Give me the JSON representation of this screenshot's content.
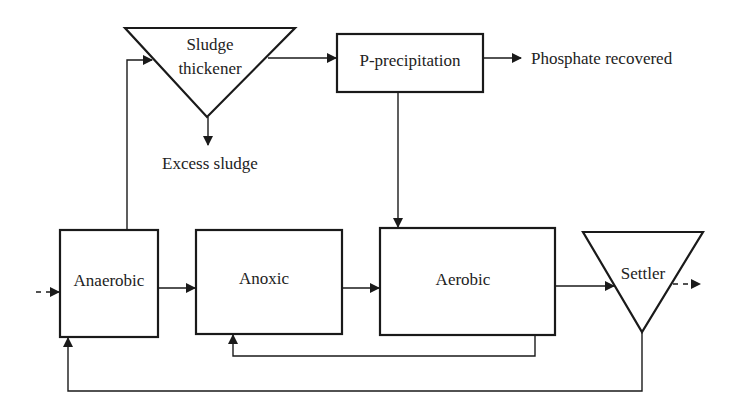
{
  "diagram": {
    "type": "process-flow",
    "title": "",
    "colors": {
      "stroke": "#1a1a1a",
      "text": "#222222",
      "background": "#ffffff"
    },
    "nodes": [
      {
        "id": "sludge_thickener",
        "shape": "inverted-triangle",
        "label_line1": "Sludge",
        "label_line2": "thickener"
      },
      {
        "id": "p_precipitation",
        "shape": "rectangle",
        "label": "P-precipitation"
      },
      {
        "id": "phosphate_recovered",
        "shape": "text",
        "label": "Phosphate recovered"
      },
      {
        "id": "excess_sludge",
        "shape": "text",
        "label": "Excess sludge"
      },
      {
        "id": "anaerobic",
        "shape": "rectangle",
        "label": "Anaerobic"
      },
      {
        "id": "anoxic",
        "shape": "rectangle",
        "label": "Anoxic"
      },
      {
        "id": "aerobic",
        "shape": "rectangle",
        "label": "Aerobic"
      },
      {
        "id": "settler",
        "shape": "inverted-triangle",
        "label": "Settler"
      }
    ],
    "edges": [
      {
        "from": "influent",
        "to": "anaerobic",
        "style": "dashed"
      },
      {
        "from": "anaerobic",
        "to": "sludge_thickener"
      },
      {
        "from": "sludge_thickener",
        "to": "p_precipitation"
      },
      {
        "from": "sludge_thickener",
        "to": "excess_sludge"
      },
      {
        "from": "p_precipitation",
        "to": "phosphate_recovered"
      },
      {
        "from": "p_precipitation",
        "to": "aerobic"
      },
      {
        "from": "anaerobic",
        "to": "anoxic"
      },
      {
        "from": "anoxic",
        "to": "aerobic"
      },
      {
        "from": "aerobic",
        "to": "settler"
      },
      {
        "from": "aerobic",
        "to": "anoxic",
        "note": "internal recycle"
      },
      {
        "from": "settler",
        "to": "anaerobic",
        "note": "sludge return"
      },
      {
        "from": "settler",
        "to": "effluent",
        "style": "dashed"
      }
    ]
  }
}
